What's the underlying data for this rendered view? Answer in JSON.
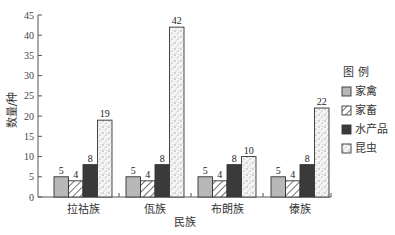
{
  "chart_data": {
    "type": "bar",
    "title": "",
    "xlabel": "民族",
    "ylabel": "数量/种",
    "ylim": [
      0,
      45
    ],
    "yticks": [
      0,
      5,
      10,
      15,
      20,
      25,
      30,
      35,
      40,
      45
    ],
    "grid": false,
    "legend_position": "right",
    "legend_title": "图 例",
    "categories": [
      "拉祜族",
      "佤族",
      "布朗族",
      "傣族"
    ],
    "series": [
      {
        "name": "家禽",
        "values": [
          5,
          5,
          5,
          5
        ],
        "fill": "#b8b8b8",
        "pattern": "solid-light"
      },
      {
        "name": "家畜",
        "values": [
          4,
          4,
          4,
          4
        ],
        "fill": "#ffffff",
        "pattern": "diagonal-hatch"
      },
      {
        "name": "水产品",
        "values": [
          8,
          8,
          8,
          8
        ],
        "fill": "#3a3a3a",
        "pattern": "solid-dark"
      },
      {
        "name": "昆虫",
        "values": [
          19,
          42,
          10,
          22
        ],
        "fill": "#f4f4f4",
        "pattern": "dots"
      }
    ]
  }
}
